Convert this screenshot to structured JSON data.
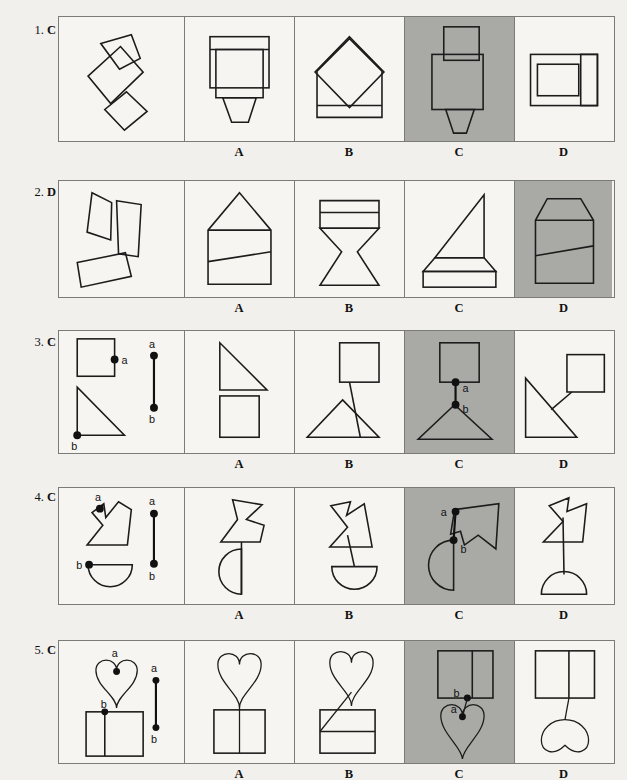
{
  "page": {
    "background_color": "#f2f0ec",
    "shaded_cell_color": "#a9a9a6",
    "stroke_color": "#1c1c1c",
    "border_color": "#7b7b78"
  },
  "option_labels": [
    "A",
    "B",
    "C",
    "D"
  ],
  "point_labels": {
    "a": "a",
    "b": "b"
  },
  "rows": [
    {
      "number": "1.",
      "answer": "C",
      "prompt_kind": "loose-quadrilaterals",
      "options": [
        {
          "letter": "A",
          "shaded": false
        },
        {
          "letter": "B",
          "shaded": false
        },
        {
          "letter": "C",
          "shaded": true
        },
        {
          "letter": "D",
          "shaded": false
        }
      ]
    },
    {
      "number": "2.",
      "answer": "D",
      "prompt_kind": "loose-trapezoids",
      "options": [
        {
          "letter": "A",
          "shaded": false
        },
        {
          "letter": "B",
          "shaded": false
        },
        {
          "letter": "C",
          "shaded": false
        },
        {
          "letter": "D",
          "shaded": true
        }
      ]
    },
    {
      "number": "3.",
      "answer": "C",
      "prompt_kind": "square-and-triangle",
      "options": [
        {
          "letter": "A",
          "shaded": false
        },
        {
          "letter": "B",
          "shaded": false
        },
        {
          "letter": "C",
          "shaded": true
        },
        {
          "letter": "D",
          "shaded": false
        }
      ]
    },
    {
      "number": "4.",
      "answer": "C",
      "prompt_kind": "arrowhead-and-halfdisc",
      "options": [
        {
          "letter": "A",
          "shaded": false
        },
        {
          "letter": "B",
          "shaded": false
        },
        {
          "letter": "C",
          "shaded": true
        },
        {
          "letter": "D",
          "shaded": false
        }
      ]
    },
    {
      "number": "5.",
      "answer": "C",
      "prompt_kind": "heart-and-square",
      "options": [
        {
          "letter": "A",
          "shaded": false
        },
        {
          "letter": "B",
          "shaded": false
        },
        {
          "letter": "C",
          "shaded": true
        },
        {
          "letter": "D",
          "shaded": false
        }
      ]
    }
  ]
}
